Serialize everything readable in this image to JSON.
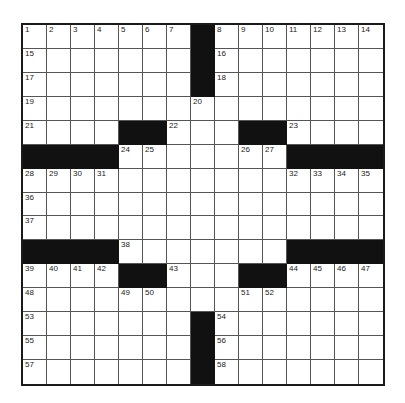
{
  "puzzle": {
    "rows": 15,
    "cols": 15,
    "colors": {
      "block": "#111111",
      "cell": "#ffffff",
      "grid_line": "#555555",
      "number": "#222222"
    },
    "blacks": [
      [
        0,
        7
      ],
      [
        1,
        7
      ],
      [
        2,
        7
      ],
      [
        4,
        4
      ],
      [
        4,
        5
      ],
      [
        4,
        9
      ],
      [
        4,
        10
      ],
      [
        5,
        0
      ],
      [
        5,
        1
      ],
      [
        5,
        2
      ],
      [
        5,
        3
      ],
      [
        5,
        11
      ],
      [
        5,
        12
      ],
      [
        5,
        13
      ],
      [
        5,
        14
      ],
      [
        9,
        0
      ],
      [
        9,
        1
      ],
      [
        9,
        2
      ],
      [
        9,
        3
      ],
      [
        9,
        11
      ],
      [
        9,
        12
      ],
      [
        9,
        13
      ],
      [
        9,
        14
      ],
      [
        10,
        4
      ],
      [
        10,
        5
      ],
      [
        10,
        9
      ],
      [
        10,
        10
      ],
      [
        12,
        7
      ],
      [
        13,
        7
      ],
      [
        14,
        7
      ]
    ],
    "numbers": [
      {
        "r": 0,
        "c": 0,
        "n": "1"
      },
      {
        "r": 0,
        "c": 1,
        "n": "2"
      },
      {
        "r": 0,
        "c": 2,
        "n": "3"
      },
      {
        "r": 0,
        "c": 3,
        "n": "4"
      },
      {
        "r": 0,
        "c": 4,
        "n": "5"
      },
      {
        "r": 0,
        "c": 5,
        "n": "6"
      },
      {
        "r": 0,
        "c": 6,
        "n": "7"
      },
      {
        "r": 0,
        "c": 8,
        "n": "8"
      },
      {
        "r": 0,
        "c": 9,
        "n": "9"
      },
      {
        "r": 0,
        "c": 10,
        "n": "10"
      },
      {
        "r": 0,
        "c": 11,
        "n": "11"
      },
      {
        "r": 0,
        "c": 12,
        "n": "12"
      },
      {
        "r": 0,
        "c": 13,
        "n": "13"
      },
      {
        "r": 0,
        "c": 14,
        "n": "14"
      },
      {
        "r": 1,
        "c": 0,
        "n": "15"
      },
      {
        "r": 1,
        "c": 8,
        "n": "16"
      },
      {
        "r": 2,
        "c": 0,
        "n": "17"
      },
      {
        "r": 2,
        "c": 8,
        "n": "18"
      },
      {
        "r": 3,
        "c": 0,
        "n": "19"
      },
      {
        "r": 3,
        "c": 7,
        "n": "20"
      },
      {
        "r": 4,
        "c": 0,
        "n": "21"
      },
      {
        "r": 4,
        "c": 6,
        "n": "22"
      },
      {
        "r": 4,
        "c": 11,
        "n": "23"
      },
      {
        "r": 5,
        "c": 4,
        "n": "24"
      },
      {
        "r": 5,
        "c": 5,
        "n": "25"
      },
      {
        "r": 5,
        "c": 9,
        "n": "26"
      },
      {
        "r": 5,
        "c": 10,
        "n": "27"
      },
      {
        "r": 6,
        "c": 0,
        "n": "28"
      },
      {
        "r": 6,
        "c": 1,
        "n": "29"
      },
      {
        "r": 6,
        "c": 2,
        "n": "30"
      },
      {
        "r": 6,
        "c": 3,
        "n": "31"
      },
      {
        "r": 6,
        "c": 11,
        "n": "32"
      },
      {
        "r": 6,
        "c": 12,
        "n": "33"
      },
      {
        "r": 6,
        "c": 13,
        "n": "34"
      },
      {
        "r": 6,
        "c": 14,
        "n": "35"
      },
      {
        "r": 7,
        "c": 0,
        "n": "36"
      },
      {
        "r": 8,
        "c": 0,
        "n": "37"
      },
      {
        "r": 9,
        "c": 4,
        "n": "38"
      },
      {
        "r": 10,
        "c": 0,
        "n": "39"
      },
      {
        "r": 10,
        "c": 1,
        "n": "40"
      },
      {
        "r": 10,
        "c": 2,
        "n": "41"
      },
      {
        "r": 10,
        "c": 3,
        "n": "42"
      },
      {
        "r": 10,
        "c": 6,
        "n": "43"
      },
      {
        "r": 10,
        "c": 11,
        "n": "44"
      },
      {
        "r": 10,
        "c": 12,
        "n": "45"
      },
      {
        "r": 10,
        "c": 13,
        "n": "46"
      },
      {
        "r": 10,
        "c": 14,
        "n": "47"
      },
      {
        "r": 11,
        "c": 0,
        "n": "48"
      },
      {
        "r": 11,
        "c": 4,
        "n": "49"
      },
      {
        "r": 11,
        "c": 5,
        "n": "50"
      },
      {
        "r": 11,
        "c": 9,
        "n": "51"
      },
      {
        "r": 11,
        "c": 10,
        "n": "52"
      },
      {
        "r": 12,
        "c": 0,
        "n": "53"
      },
      {
        "r": 12,
        "c": 8,
        "n": "54"
      },
      {
        "r": 13,
        "c": 0,
        "n": "55"
      },
      {
        "r": 13,
        "c": 8,
        "n": "56"
      },
      {
        "r": 14,
        "c": 0,
        "n": "57"
      },
      {
        "r": 14,
        "c": 8,
        "n": "58"
      }
    ]
  }
}
